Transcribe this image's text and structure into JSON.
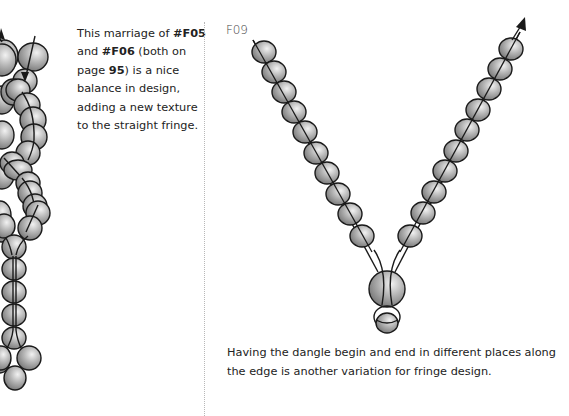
{
  "left_panel": {
    "caption_parts": [
      {
        "text": "This marriage of ",
        "bold": false
      },
      {
        "text": "#F05",
        "bold": true
      },
      {
        "text": " and ",
        "bold": false
      },
      {
        "text": "#F06",
        "bold": true
      },
      {
        "text": " (both on page ",
        "bold": false
      },
      {
        "text": "95",
        "bold": true
      },
      {
        "text": ") is a nice balance in design, adding a new texture to the straight fringe.",
        "bold": false
      }
    ],
    "illustration": "bead-fringe-combination-icon"
  },
  "right_panel": {
    "figure_label": "F09",
    "illustration": "v-shaped-bead-dangle-icon",
    "caption": "Having the dangle begin and end in different places along the edge is another variation for fringe design."
  },
  "colors": {
    "bead_fill_light": "#e6e6e6",
    "bead_fill_dark": "#7a7a7a",
    "bead_outline": "#1a1a1a",
    "divider": "#b8b8b8"
  }
}
